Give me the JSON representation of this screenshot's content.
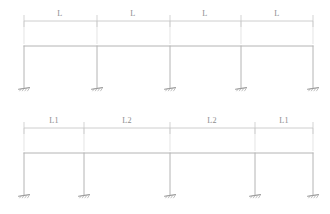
{
  "document": {
    "kind": "structural-frame-elevation-drawing",
    "panel_count": 2,
    "line_color": "#b4b4b4",
    "dimension_color": "#c2c2c2",
    "label_color": "#8d8d8d",
    "background_color": "#ffffff"
  },
  "panels": [
    {
      "id": "top-frame",
      "name": "equal-bay-frame",
      "support_type": "fixed",
      "column_count": 5,
      "bay_count": 4,
      "beam": {
        "y": 46,
        "x_start": 24,
        "x_end": 313
      },
      "column_base_y": 88,
      "dimension_line": {
        "y": 21,
        "x_start": 24,
        "x_end": 313,
        "tick_top": 15,
        "tick_bottom": 27
      },
      "columns_x": [
        24,
        97,
        170,
        241,
        313
      ],
      "bays": [
        {
          "label": "L",
          "center_x": 60,
          "start_x": 24,
          "end_x": 97
        },
        {
          "label": "L",
          "center_x": 133,
          "start_x": 97,
          "end_x": 170
        },
        {
          "label": "L",
          "center_x": 205,
          "start_x": 170,
          "end_x": 241
        },
        {
          "label": "L",
          "center_x": 277,
          "start_x": 241,
          "end_x": 313
        }
      ]
    },
    {
      "id": "bottom-frame",
      "name": "unequal-bay-frame",
      "support_type": "fixed",
      "column_count": 5,
      "bay_count": 4,
      "beam": {
        "y": 153,
        "x_start": 24,
        "x_end": 313
      },
      "column_base_y": 195,
      "dimension_line": {
        "y": 128,
        "x_start": 24,
        "x_end": 313,
        "tick_top": 122,
        "tick_bottom": 134
      },
      "columns_x": [
        24,
        84,
        170,
        255,
        313
      ],
      "bays": [
        {
          "label": "L1",
          "center_x": 54,
          "start_x": 24,
          "end_x": 84
        },
        {
          "label": "L2",
          "center_x": 127,
          "start_x": 84,
          "end_x": 170
        },
        {
          "label": "L2",
          "center_x": 212,
          "start_x": 170,
          "end_x": 255
        },
        {
          "label": "L1",
          "center_x": 284,
          "start_x": 255,
          "end_x": 313
        }
      ]
    }
  ]
}
